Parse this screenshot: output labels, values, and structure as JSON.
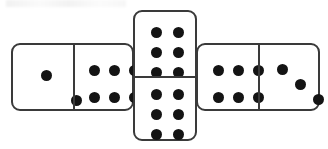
{
  "scene": {
    "title": "Three dominoes arranged in a cross / T layout",
    "background_color": "#ffffff",
    "pip_color": "#141414",
    "tile_border_color": "#3a3a3a",
    "tile_face_color": "#ffffff",
    "width": 328,
    "height": 149
  },
  "dominoes": [
    {
      "id": "domino-left",
      "name": "left-domino",
      "orientation": "horizontal",
      "label": "2 | 6",
      "total_pips": 8,
      "halves": [
        {
          "name": "left-domino-left-half",
          "value": 2,
          "arrangement": "diagonal",
          "pips": [
            {
              "x": 33,
              "y": 30
            },
            {
              "x": 63,
              "y": 55
            }
          ]
        },
        {
          "name": "left-domino-right-half",
          "value": 6,
          "arrangement": "two-rows-of-three",
          "pips": [
            {
              "x": 20,
              "y": 25
            },
            {
              "x": 40,
              "y": 25
            },
            {
              "x": 60,
              "y": 25
            },
            {
              "x": 20,
              "y": 52
            },
            {
              "x": 40,
              "y": 52
            },
            {
              "x": 60,
              "y": 52
            }
          ]
        }
      ]
    },
    {
      "id": "domino-center",
      "name": "center-domino",
      "orientation": "vertical",
      "label": "6 | 6",
      "total_pips": 12,
      "halves": [
        {
          "name": "center-domino-top-half",
          "value": 6,
          "arrangement": "three-rows-of-two",
          "pips": [
            {
              "x": 21,
              "y": 20
            },
            {
              "x": 43,
              "y": 20
            },
            {
              "x": 21,
              "y": 40
            },
            {
              "x": 43,
              "y": 40
            },
            {
              "x": 21,
              "y": 60
            },
            {
              "x": 43,
              "y": 60
            }
          ]
        },
        {
          "name": "center-domino-bottom-half",
          "value": 6,
          "arrangement": "three-rows-of-two",
          "pips": [
            {
              "x": 21,
              "y": 17
            },
            {
              "x": 43,
              "y": 17
            },
            {
              "x": 21,
              "y": 37
            },
            {
              "x": 43,
              "y": 37
            },
            {
              "x": 21,
              "y": 57
            },
            {
              "x": 43,
              "y": 57
            }
          ]
        }
      ]
    },
    {
      "id": "domino-right",
      "name": "right-domino",
      "orientation": "horizontal",
      "label": "6 | 3",
      "total_pips": 9,
      "halves": [
        {
          "name": "right-domino-left-half",
          "value": 6,
          "arrangement": "two-rows-of-three",
          "pips": [
            {
              "x": 20,
              "y": 25
            },
            {
              "x": 40,
              "y": 25
            },
            {
              "x": 60,
              "y": 25
            },
            {
              "x": 20,
              "y": 52
            },
            {
              "x": 40,
              "y": 52
            },
            {
              "x": 60,
              "y": 52
            }
          ]
        },
        {
          "name": "right-domino-right-half",
          "value": 3,
          "arrangement": "diagonal",
          "pips": [
            {
              "x": 22,
              "y": 24
            },
            {
              "x": 40,
              "y": 39
            },
            {
              "x": 58,
              "y": 54
            }
          ]
        }
      ]
    }
  ]
}
